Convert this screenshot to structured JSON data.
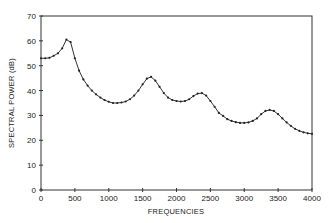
{
  "chart_data": {
    "type": "line",
    "title": "",
    "xlabel": "FREQUENCIES",
    "ylabel": "SPECTRAL POWER (dB)",
    "xlim": [
      0,
      4000
    ],
    "ylim": [
      0,
      70
    ],
    "xticks": [
      0,
      500,
      1000,
      1500,
      2000,
      2500,
      3000,
      3500,
      4000
    ],
    "yticks": [
      0,
      10,
      20,
      30,
      40,
      50,
      60,
      70
    ],
    "grid": false,
    "legend": null,
    "marker": "dot",
    "series": [
      {
        "name": "spectrum",
        "x": [
          0,
          62.5,
          125,
          187.5,
          250,
          312.5,
          375,
          437.5,
          500,
          562.5,
          625,
          687.5,
          750,
          812.5,
          875,
          937.5,
          1000,
          1062.5,
          1125,
          1187.5,
          1250,
          1312.5,
          1375,
          1437.5,
          1500,
          1562.5,
          1625,
          1687.5,
          1750,
          1812.5,
          1875,
          1937.5,
          2000,
          2062.5,
          2125,
          2187.5,
          2250,
          2312.5,
          2375,
          2437.5,
          2500,
          2562.5,
          2625,
          2687.5,
          2750,
          2812.5,
          2875,
          2937.5,
          3000,
          3062.5,
          3125,
          3187.5,
          3250,
          3312.5,
          3375,
          3437.5,
          3500,
          3562.5,
          3625,
          3687.5,
          3750,
          3812.5,
          3875,
          3937.5,
          4000
        ],
        "values": [
          53,
          53,
          53.2,
          54,
          55,
          57,
          60.5,
          59.5,
          53,
          48,
          44.5,
          42,
          40,
          38.5,
          37.2,
          36.2,
          35.5,
          35,
          35,
          35.2,
          35.6,
          36.5,
          38,
          40,
          42.5,
          44.8,
          45.5,
          44,
          41.5,
          39,
          37.2,
          36.2,
          35.8,
          35.6,
          35.8,
          36.5,
          37.8,
          38.8,
          39,
          38,
          35.8,
          33.5,
          31,
          29.8,
          28.5,
          27.8,
          27.3,
          27,
          27,
          27.2,
          27.8,
          28.8,
          30.5,
          31.8,
          32.2,
          31.8,
          30.5,
          28.8,
          27.2,
          25.8,
          24.6,
          23.8,
          23.2,
          22.8,
          22.6
        ]
      }
    ]
  },
  "axes": {
    "x_title": "FREQUENCIES",
    "y_title": "SPECTRAL POWER (dB)",
    "x_tick_labels": [
      "0",
      "500",
      "1000",
      "1500",
      "2000",
      "2500",
      "3000",
      "3500",
      "4000"
    ],
    "y_tick_labels": [
      "0",
      "10",
      "20",
      "30",
      "40",
      "50",
      "60",
      "70"
    ]
  },
  "colors": {
    "line": "#333333",
    "marker": "#222222",
    "axis": "#333333",
    "background": "#ffffff"
  }
}
